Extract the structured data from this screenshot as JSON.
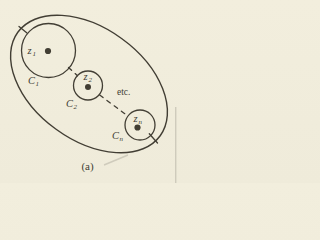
{
  "figure": {
    "caption": "(a)",
    "etc_label": "etc.",
    "circles": [
      {
        "name": "C1",
        "label_base": "C",
        "label_sub": "1",
        "point_base": "z",
        "point_sub": "1"
      },
      {
        "name": "C2",
        "label_base": "C",
        "label_sub": "2",
        "point_base": "z",
        "point_sub": "2"
      },
      {
        "name": "Cn",
        "label_base": "C",
        "label_sub": "n",
        "point_base": "z",
        "point_sub": "n"
      }
    ],
    "colors": {
      "background": "#f2eedd",
      "line": "#423e34",
      "text": "#423e34",
      "artifact": "#c9c5b6"
    }
  }
}
